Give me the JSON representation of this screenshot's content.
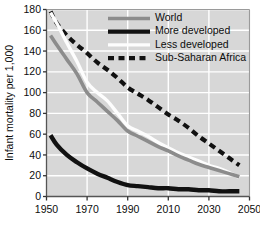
{
  "chart_data": {
    "type": "line",
    "title": "",
    "xlabel": "",
    "ylabel": "Infant mortality per 1,000",
    "xlim": [
      1950,
      2050
    ],
    "ylim": [
      0,
      180
    ],
    "xticks": [
      1950,
      1970,
      1990,
      2010,
      2030,
      2050
    ],
    "yticks": [
      0,
      20,
      40,
      60,
      80,
      100,
      120,
      140,
      160,
      180
    ],
    "grid": true,
    "legend_position": "top-right",
    "plot_background": "#d7d7d7",
    "gridline_color": "#ffffff",
    "series": [
      {
        "name": "World",
        "color": "#8c8c8c",
        "style": "solid",
        "x": [
          1952,
          1955,
          1960,
          1965,
          1970,
          1975,
          1980,
          1985,
          1990,
          1995,
          2000,
          2005,
          2010,
          2015,
          2020,
          2025,
          2030,
          2035,
          2040,
          2045
        ],
        "values": [
          155,
          146,
          132,
          118,
          100,
          91,
          82,
          73,
          63,
          58,
          53,
          48,
          44,
          39,
          35,
          31,
          28,
          25,
          22,
          19
        ]
      },
      {
        "name": "More developed",
        "color": "#111111",
        "style": "solid",
        "x": [
          1952,
          1955,
          1960,
          1965,
          1970,
          1975,
          1980,
          1985,
          1990,
          1995,
          2000,
          2005,
          2010,
          2015,
          2020,
          2025,
          2030,
          2035,
          2040,
          2045
        ],
        "values": [
          59,
          50,
          40,
          33,
          27,
          22,
          18,
          14,
          11,
          10,
          9,
          8,
          8,
          7,
          7,
          6,
          6,
          5,
          5,
          5
        ]
      },
      {
        "name": "Less developed",
        "color": "#fdfdfd",
        "style": "solid",
        "x": [
          1952,
          1955,
          1960,
          1965,
          1970,
          1975,
          1980,
          1985,
          1990,
          1995,
          2000,
          2005,
          2010,
          2015,
          2020,
          2025,
          2030,
          2035,
          2040,
          2045
        ],
        "values": [
          177,
          167,
          148,
          130,
          110,
          100,
          92,
          80,
          68,
          63,
          58,
          52,
          47,
          42,
          38,
          34,
          30,
          27,
          23,
          18
        ]
      },
      {
        "name": "Sub-Saharan Africa",
        "color": "#111111",
        "style": "dashed",
        "x": [
          1952,
          1955,
          1960,
          1965,
          1970,
          1975,
          1980,
          1985,
          1990,
          1995,
          2000,
          2005,
          2010,
          2015,
          2020,
          2025,
          2030,
          2035,
          2040,
          2045
        ],
        "values": [
          178,
          167,
          155,
          146,
          138,
          129,
          122,
          114,
          105,
          99,
          93,
          86,
          79,
          73,
          66,
          58,
          51,
          44,
          37,
          30
        ]
      }
    ],
    "legend_entries": [
      {
        "label": "World",
        "color": "#8c8c8c",
        "style": "solid",
        "width": 3.6
      },
      {
        "label": "More developed",
        "color": "#111111",
        "style": "solid",
        "width": 4.2
      },
      {
        "label": "Less developed",
        "color": "#fdfdfd",
        "style": "solid",
        "width": 3.2
      },
      {
        "label": "Sub-Saharan Africa",
        "color": "#111111",
        "style": "dashed",
        "width": 4.2
      }
    ]
  }
}
